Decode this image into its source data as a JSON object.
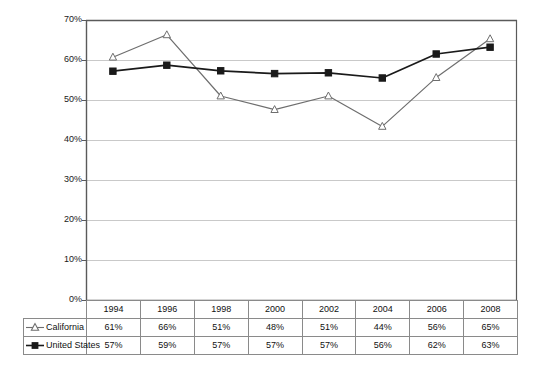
{
  "chart_data": {
    "type": "line",
    "title": "",
    "subtitle": "",
    "xlabel": "",
    "ylabel": "",
    "categories": [
      "1994",
      "1996",
      "1998",
      "2000",
      "2002",
      "2004",
      "2006",
      "2008"
    ],
    "ylim": [
      0,
      70
    ],
    "ytick_labels": [
      "0%",
      "10%",
      "20%",
      "30%",
      "40%",
      "50%",
      "60%",
      "70%"
    ],
    "ytick_values": [
      0,
      10,
      20,
      30,
      40,
      50,
      60,
      70
    ],
    "grid": "horizontal",
    "legend_position": "table-row-headers",
    "series": [
      {
        "name": "California",
        "marker": "open-triangle",
        "color": "#6e6e6e",
        "marker_fill": "#ffffff",
        "values": [
          61,
          66,
          51,
          48,
          51,
          44,
          56,
          65
        ],
        "plotted_values": [
          60.7,
          66.3,
          51.0,
          47.6,
          51.0,
          43.4,
          55.6,
          65.3
        ],
        "labels": [
          "61%",
          "66%",
          "51%",
          "48%",
          "51%",
          "44%",
          "56%",
          "65%"
        ]
      },
      {
        "name": "United States",
        "marker": "filled-square",
        "color": "#1a1a1a",
        "marker_fill": "#1a1a1a",
        "values": [
          57,
          59,
          57,
          57,
          57,
          56,
          62,
          63
        ],
        "plotted_values": [
          57.2,
          58.7,
          57.3,
          56.6,
          56.8,
          55.5,
          61.5,
          63.2
        ],
        "labels": [
          "57%",
          "59%",
          "57%",
          "57%",
          "57%",
          "56%",
          "62%",
          "63%"
        ]
      }
    ],
    "table": {
      "corner_label": "",
      "column_headers": [
        "1994",
        "1996",
        "1998",
        "2000",
        "2002",
        "2004",
        "2006",
        "2008"
      ],
      "rows": [
        {
          "label": "California",
          "marker_icon": "open-triangle-line-marker",
          "cells": [
            "61%",
            "66%",
            "51%",
            "48%",
            "51%",
            "44%",
            "56%",
            "65%"
          ]
        },
        {
          "label": "United States",
          "marker_icon": "filled-square-line-marker",
          "cells": [
            "57%",
            "59%",
            "57%",
            "57%",
            "57%",
            "56%",
            "62%",
            "63%"
          ]
        }
      ]
    },
    "colors": {
      "california_line": "#6e6e6e",
      "united_states_line": "#1a1a1a",
      "gridline": "#c9c9c9",
      "axis": "#5a5a5a",
      "table_border": "#8a8a8a",
      "background": "#ffffff"
    }
  }
}
